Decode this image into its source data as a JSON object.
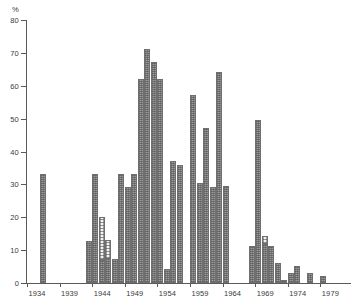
{
  "chart_data": {
    "type": "bar",
    "title": "",
    "subtitle": "",
    "xlabel": "",
    "ylabel": "%",
    "unit_label": "%",
    "ylim": [
      0,
      80
    ],
    "xlim": [
      1934,
      1981
    ],
    "grid": false,
    "legend": false,
    "legend_position": "none",
    "y_ticks": [
      0,
      10,
      20,
      30,
      40,
      50,
      60,
      70,
      80
    ],
    "y_tick_labels": [
      "0",
      "10",
      "20",
      "30",
      "40",
      "50",
      "60",
      "70",
      "80"
    ],
    "x_ticks": [
      1934,
      1939,
      1944,
      1949,
      1954,
      1959,
      1964,
      1969,
      1974,
      1979
    ],
    "x_tick_labels": [
      "1934",
      "1939",
      "1944",
      "1949",
      "1954",
      "1959",
      "1964",
      "1969",
      "1974",
      "1979"
    ],
    "series": [
      {
        "name": "hatched",
        "fill": "hatched-grey",
        "color": "#9a9a9a",
        "categories": [
          1936,
          1943,
          1944,
          1945,
          1946,
          1948,
          1949,
          1950,
          1951,
          1952,
          1953,
          1954,
          1955,
          1956,
          1957,
          1959,
          1960,
          1961,
          1962,
          1963,
          1964,
          1968,
          1969,
          1970,
          1971,
          1972,
          1973,
          1974,
          1975,
          1977,
          1979
        ],
        "values": [
          33.1,
          12.7,
          33.1,
          7.0,
          7.2,
          33.1,
          29.3,
          33.2,
          62.2,
          71.2,
          67.2,
          62.2,
          4.2,
          37.2,
          36.0,
          57.2,
          30.5,
          47.3,
          29.3,
          64.3,
          29.4,
          11.4,
          49.5,
          12.0,
          11.3,
          6.2,
          1.0,
          3.1,
          5.2,
          3.1,
          2.2
        ]
      },
      {
        "name": "dotted-light",
        "fill": "dotted-light",
        "color": "#f2f2f2",
        "categories": [
          1944,
          1945,
          1970
        ],
        "segment_bottom": [
          7.0,
          7.2,
          12.0
        ],
        "segment_top": [
          20.2,
          13.1,
          14.2
        ],
        "values": [
          13.2,
          5.9,
          2.2
        ]
      }
    ],
    "bars": [
      {
        "year": 1936,
        "value": 33.1,
        "fill": "hatched-grey"
      },
      {
        "year": 1943,
        "value": 12.7,
        "fill": "hatched-grey"
      },
      {
        "year": 1944,
        "value": 33.1,
        "fill": "hatched-grey"
      },
      {
        "year": 1945,
        "value": 7.0,
        "fill": "hatched-grey",
        "overlay_from": 7.0,
        "overlay_to": 20.2,
        "overlay_fill": "dotted-light"
      },
      {
        "year": 1946,
        "value": 7.2,
        "fill": "hatched-grey",
        "overlay_from": 7.2,
        "overlay_to": 13.1,
        "overlay_fill": "dotted-light"
      },
      {
        "year": 1947,
        "value": 7.2,
        "fill": "hatched-grey"
      },
      {
        "year": 1948,
        "value": 33.1,
        "fill": "hatched-grey"
      },
      {
        "year": 1949,
        "value": 29.3,
        "fill": "hatched-grey"
      },
      {
        "year": 1950,
        "value": 33.2,
        "fill": "hatched-grey"
      },
      {
        "year": 1951,
        "value": 62.2,
        "fill": "hatched-grey"
      },
      {
        "year": 1952,
        "value": 71.2,
        "fill": "hatched-grey"
      },
      {
        "year": 1953,
        "value": 67.2,
        "fill": "hatched-grey"
      },
      {
        "year": 1954,
        "value": 62.2,
        "fill": "hatched-grey"
      },
      {
        "year": 1955,
        "value": 4.2,
        "fill": "hatched-grey"
      },
      {
        "year": 1956,
        "value": 37.2,
        "fill": "hatched-grey"
      },
      {
        "year": 1957,
        "value": 36.0,
        "fill": "hatched-grey"
      },
      {
        "year": 1959,
        "value": 57.2,
        "fill": "hatched-grey"
      },
      {
        "year": 1960,
        "value": 30.5,
        "fill": "hatched-grey"
      },
      {
        "year": 1961,
        "value": 47.3,
        "fill": "hatched-grey"
      },
      {
        "year": 1962,
        "value": 29.3,
        "fill": "hatched-grey"
      },
      {
        "year": 1963,
        "value": 64.3,
        "fill": "hatched-grey"
      },
      {
        "year": 1964,
        "value": 29.4,
        "fill": "hatched-grey"
      },
      {
        "year": 1968,
        "value": 11.4,
        "fill": "hatched-grey"
      },
      {
        "year": 1969,
        "value": 49.5,
        "fill": "hatched-grey"
      },
      {
        "year": 1970,
        "value": 12.0,
        "fill": "hatched-grey",
        "overlay_from": 12.0,
        "overlay_to": 14.2,
        "overlay_fill": "dotted-light"
      },
      {
        "year": 1971,
        "value": 11.3,
        "fill": "hatched-grey"
      },
      {
        "year": 1972,
        "value": 6.2,
        "fill": "hatched-grey"
      },
      {
        "year": 1973,
        "value": 1.0,
        "fill": "hatched-grey"
      },
      {
        "year": 1974,
        "value": 3.1,
        "fill": "hatched-grey"
      },
      {
        "year": 1975,
        "value": 5.2,
        "fill": "hatched-grey"
      },
      {
        "year": 1977,
        "value": 3.1,
        "fill": "hatched-grey"
      },
      {
        "year": 1979,
        "value": 2.2,
        "fill": "hatched-grey"
      }
    ]
  },
  "colors": {
    "axis": "#5a5a5a",
    "bar_fill": "#9a9a9a",
    "bar_edge": "#6f6f6f",
    "bar_light_fill": "#f2f2f2",
    "text": "#3a3a3a",
    "background": "#ffffff"
  }
}
